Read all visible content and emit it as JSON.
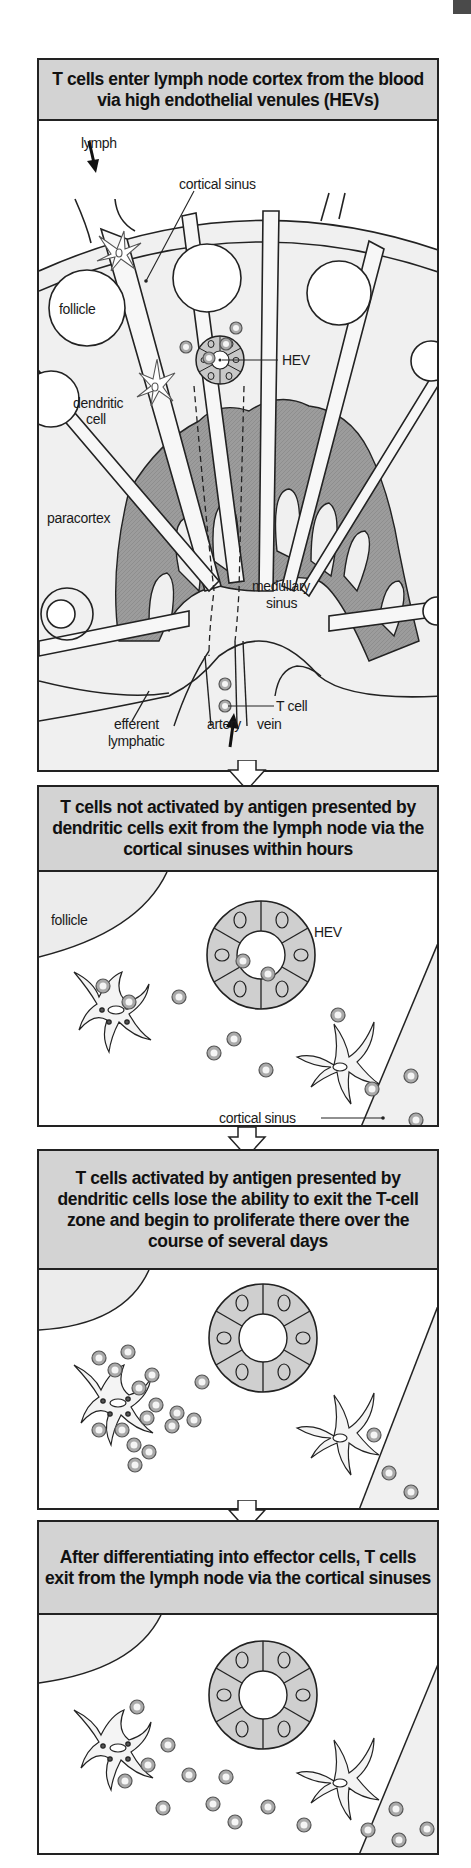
{
  "figure": {
    "type": "flow-diagram",
    "panels": [
      {
        "id": 1,
        "header": "T cells enter lymph node cortex from the blood via high endothelial venules (HEVs)",
        "labels": {
          "lymph": "lymph",
          "cortical_sinus": "cortical sinus",
          "follicle": "follicle",
          "hev": "HEV",
          "dendritic_cell": "dendritic cell",
          "dendritic_line1": "dendritic",
          "dendritic_line2": "cell",
          "paracortex": "paracortex",
          "medullary_sinus_line1": "medullary",
          "medullary_sinus_line2": "sinus",
          "t_cell": "T cell",
          "efferent_line1": "efferent",
          "efferent_line2": "lymphatic",
          "artery": "artery",
          "vein": "vein"
        }
      },
      {
        "id": 2,
        "header": "T cells not activated by antigen presented by dendritic cells exit from the lymph node via the cortical sinuses within hours",
        "labels": {
          "follicle": "follicle",
          "hev": "HEV",
          "cortical_sinus": "cortical sinus"
        }
      },
      {
        "id": 3,
        "header": "T cells activated by antigen presented by dendritic cells lose the ability to exit the T-cell zone and begin to proliferate there over the course of several days",
        "labels": {}
      },
      {
        "id": 4,
        "header": "After differentiating into effector cells, T cells exit from the lymph node via the cortical sinuses",
        "labels": {}
      }
    ],
    "colors": {
      "header_fill": "#d3d3d3",
      "tissue_dark": "#9a9a9a",
      "tissue_light": "#e8e8e8",
      "outline": "#222222",
      "hev_cells": "#cfcfcf",
      "t_cell_ring": "#8a8a8a"
    }
  }
}
